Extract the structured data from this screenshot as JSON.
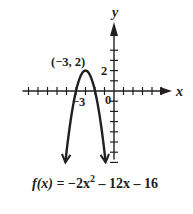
{
  "chart_data": {
    "type": "line",
    "title": "",
    "function": "f(x) = -2x^2 - 12x - 16",
    "equation_label": {
      "lhs": "f(x) = ",
      "a": "−2x",
      "exp": "2",
      "rest": " – 12x – 16"
    },
    "xlabel": "x",
    "ylabel": "y",
    "xlim": [
      -9,
      6
    ],
    "ylim": [
      -7,
      6
    ],
    "x_ticks_visible": [
      -9,
      -8,
      -7,
      -6,
      -5,
      -4,
      -3,
      -2,
      -1,
      1,
      2,
      3,
      4,
      5
    ],
    "y_ticks_visible": [
      -7,
      -6,
      -5,
      -4,
      -3,
      -2,
      -1,
      1,
      2,
      3,
      4
    ],
    "labeled_ticks": {
      "x": [
        {
          "value": -3,
          "label": "−3"
        }
      ],
      "y": [
        {
          "value": 2,
          "label": "2"
        }
      ],
      "origin": "0"
    },
    "vertex": {
      "x": -3,
      "y": 2,
      "label": "(−3, 2)"
    },
    "series": [
      {
        "name": "f(x)",
        "x": [
          -5.12,
          -4.5,
          -4,
          -3.5,
          -3,
          -2.5,
          -2,
          -1.5,
          -0.88
        ],
        "y": [
          -7,
          -2.5,
          0,
          1.5,
          2,
          1.5,
          0,
          -2.5,
          -7
        ]
      }
    ],
    "grid": false,
    "legend": null,
    "colors": {
      "ink": "#231f20",
      "background": "#ffffff"
    }
  }
}
